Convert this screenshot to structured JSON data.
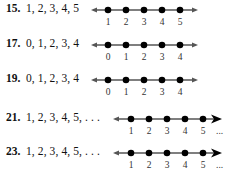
{
  "exercises": [
    {
      "number": "15.",
      "set": "1, 2, 3, 4, 5",
      "points": [
        "1",
        "2",
        "3",
        "4",
        "5"
      ],
      "continues": false
    },
    {
      "number": "17.",
      "set": "0, 1, 2, 3, 4",
      "points": [
        "0",
        "1",
        "2",
        "3",
        "4"
      ],
      "continues": false
    },
    {
      "number": "19.",
      "set": "0, 1, 2, 3, 4",
      "points": [
        "0",
        "1",
        "2",
        "3",
        "4"
      ],
      "continues": false
    },
    {
      "number": "21.",
      "set": "1, 2, 3, 4, 5, . . .",
      "points": [
        "1",
        "2",
        "3",
        "4",
        "5"
      ],
      "continues": true,
      "ellipsis": "..."
    },
    {
      "number": "23.",
      "set": "1, 2, 3, 4, 5, . . .",
      "points": [
        "1",
        "2",
        "3",
        "4",
        "5"
      ],
      "continues": true,
      "ellipsis": "..."
    }
  ],
  "colors": {
    "line": "#555555",
    "dot": "#000000",
    "text": "#111111"
  }
}
